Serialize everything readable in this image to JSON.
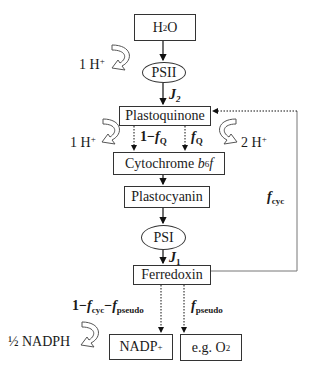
{
  "diagram": {
    "type": "photosynthetic electron transport flow diagram",
    "nodes": {
      "h2o": {
        "base": "H",
        "sub": "2",
        "tail": "O"
      },
      "psii": {
        "label": "PSII"
      },
      "plastoquinone": {
        "label": "Plastoquinone"
      },
      "cytochrome": {
        "prefix": "Cytochrome ",
        "b": "b",
        "sub": "6",
        "f": "f"
      },
      "plastocyanin": {
        "label": "Plastocyanin"
      },
      "psi": {
        "label": "PSI"
      },
      "ferredoxin": {
        "label": "Ferredoxin"
      },
      "nadp": {
        "base": "NADP",
        "sup": "+"
      },
      "o2": {
        "base": "e.g. O",
        "sub": "2"
      }
    },
    "edge_labels": {
      "j2": {
        "sym": "J",
        "sub": "2"
      },
      "j1": {
        "sym": "J",
        "sub": "1"
      },
      "one_minus_fq": {
        "prefix": "1−",
        "sym": "f",
        "sub": "Q"
      },
      "fq": {
        "sym": "f",
        "sub": "Q"
      },
      "fcyc": {
        "sym": "f",
        "sub": "cyc"
      },
      "nadp_frac": {
        "prefix": "1−",
        "sym1": "f",
        "sub1": "cyc",
        "mid": "−",
        "sym2": "f",
        "sub2": "pseudo"
      },
      "fpseudo": {
        "sym": "f",
        "sub": "pseudo"
      }
    },
    "side_products": {
      "h_psii": {
        "base": "1 H",
        "sup": "+"
      },
      "h_pq_left": {
        "base": "1 H",
        "sup": "+"
      },
      "h_pq_right": {
        "base": "2 H",
        "sup": "+"
      },
      "nadph": {
        "label": "½ NADPH"
      }
    }
  }
}
